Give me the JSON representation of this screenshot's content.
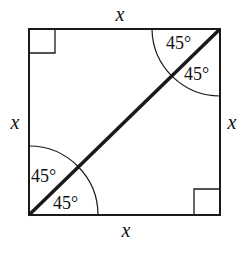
{
  "figure": {
    "side_labels": {
      "top": "x",
      "left": "x",
      "right": "x",
      "bottom": "x"
    },
    "angle_labels": {
      "top_right_upper": "45°",
      "top_right_lower": "45°",
      "bottom_left_upper": "45°",
      "bottom_left_lower": "45°"
    },
    "right_angle_markers": [
      "top-left",
      "bottom-right"
    ],
    "colors": {
      "stroke": "#1a1a1a",
      "background": "#ffffff"
    }
  }
}
